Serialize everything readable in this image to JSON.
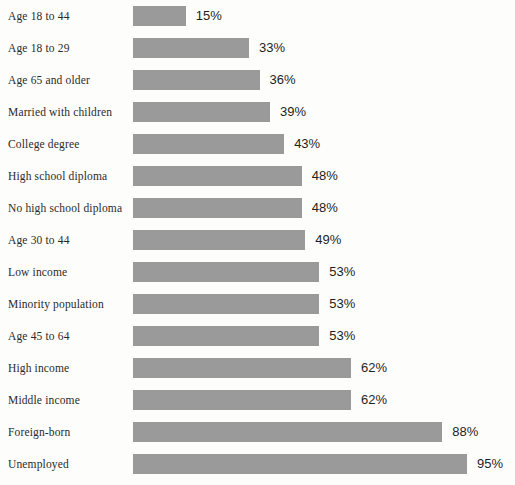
{
  "chart_data": {
    "type": "bar",
    "orientation": "horizontal",
    "title": "",
    "xlabel": "",
    "ylabel": "",
    "xlim": [
      0,
      100
    ],
    "grid": false,
    "legend": false,
    "value_suffix": "%",
    "categories": [
      "Age 18 to 44",
      "Age 18 to 29",
      "Age 65 and older",
      "Married with children",
      "College degree",
      "High school diploma",
      "No high school diploma",
      "Age 30 to 44",
      "Low income",
      "Minority population",
      "Age 45 to 64",
      "High income",
      "Middle income",
      "Foreign-born",
      "Unemployed"
    ],
    "values": [
      15,
      33,
      36,
      39,
      43,
      48,
      48,
      49,
      53,
      53,
      53,
      62,
      62,
      88,
      95
    ],
    "value_labels": [
      "15%",
      "33%",
      "36%",
      "39%",
      "43%",
      "48%",
      "48%",
      "49%",
      "53%",
      "53%",
      "53%",
      "62%",
      "62%",
      "88%",
      "95%"
    ]
  },
  "style": {
    "bar_color": "#9a9a9a",
    "background_color": "#fdfdfc",
    "label_color": "#2b2a28",
    "value_color": "#1f1e1d"
  }
}
